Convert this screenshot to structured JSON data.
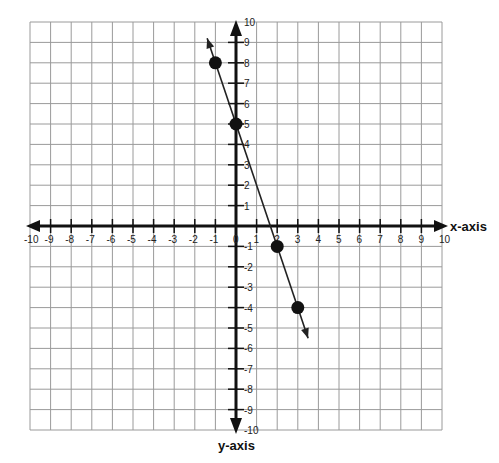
{
  "chart_data": {
    "type": "line",
    "title": "",
    "xlabel": "x-axis",
    "ylabel": "y-axis",
    "xlim": [
      -10,
      10
    ],
    "ylim": [
      -10,
      10
    ],
    "grid": true,
    "x_ticks": [
      -10,
      -9,
      -8,
      -7,
      -6,
      -5,
      -4,
      -3,
      -2,
      -1,
      0,
      1,
      2,
      3,
      4,
      5,
      6,
      7,
      8,
      9,
      10
    ],
    "y_ticks": [
      -10,
      -9,
      -8,
      -7,
      -6,
      -5,
      -4,
      -3,
      -2,
      -1,
      1,
      2,
      3,
      4,
      5,
      6,
      7,
      8,
      9,
      10
    ],
    "series": [
      {
        "name": "line",
        "points": [
          {
            "x": -1,
            "y": 8
          },
          {
            "x": 0,
            "y": 5
          },
          {
            "x": 2,
            "y": -1
          },
          {
            "x": 3,
            "y": -4
          }
        ],
        "line_extent": {
          "start": {
            "x": -1.4,
            "y": 9.2
          },
          "end": {
            "x": 3.5,
            "y": -5.5
          }
        },
        "arrows_both_ends": true
      }
    ],
    "equation_implied": "y = -3x + 5"
  },
  "colors": {
    "grid": "#9a9a9a",
    "axis": "#111111",
    "line": "#222222",
    "point": "#111111"
  }
}
